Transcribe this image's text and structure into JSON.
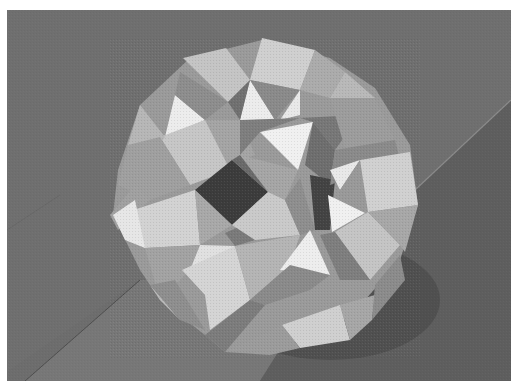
{
  "image": {
    "alt": "Grayscale photograph of a folded paper polyhedron model (hollow, with square and triangular faces and square openings) resting on a wooden floor",
    "subject": "paper polyhedron model",
    "surface": "wooden plank floor",
    "palette": {
      "background_border": "#ffffff",
      "floor_dark": "#5f5f5f",
      "floor_mid": "#6e6e6e",
      "floor_light": "#7a7a7a",
      "shadow": "#4a4a4a",
      "face_bright": "#e6e6e6",
      "face_light": "#c8c8c8",
      "face_mid": "#a8a8a8",
      "face_dark": "#888888",
      "hole": "#3c3c3c"
    }
  }
}
